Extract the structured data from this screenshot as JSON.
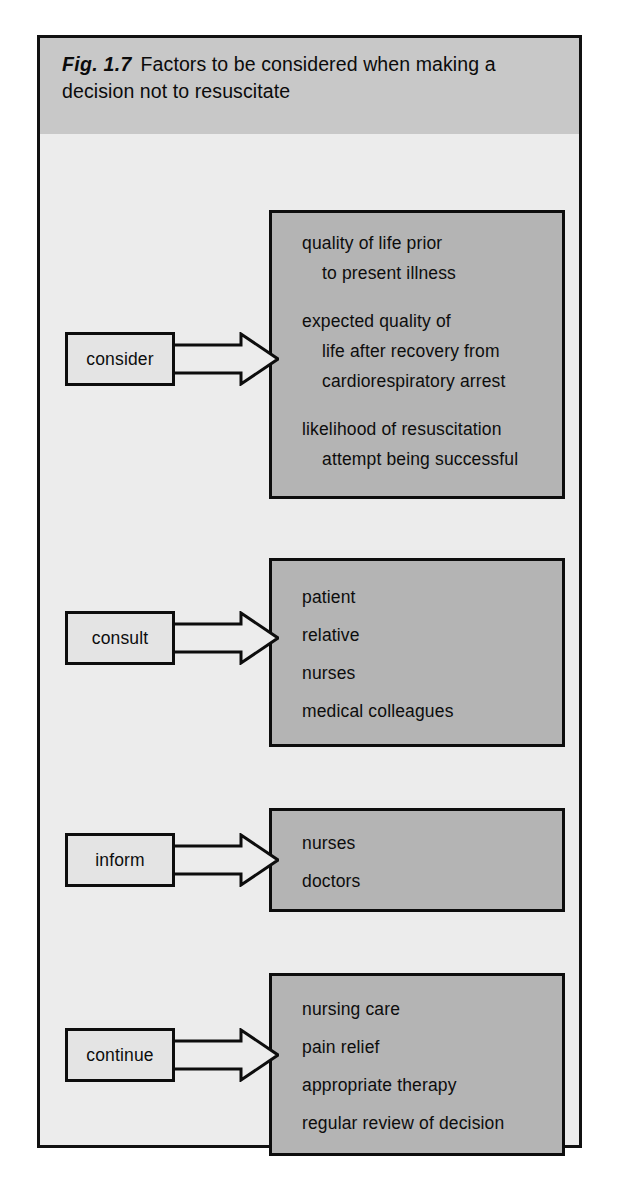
{
  "figure": {
    "caption_label": "Fig. 1.7",
    "caption_text": "Factors to be considered when making a decision not to resuscitate",
    "colors": {
      "page_background": "#ffffff",
      "frame_border": "#111111",
      "caption_band": "#c8c8c8",
      "panel_background": "#ececec",
      "content_box_fill": "#b4b4b4",
      "content_box_border": "#0d0d0d",
      "label_box_fill": "#e4e4e4",
      "arrow_fill": "#ececec",
      "text": "#0d0d0d"
    }
  },
  "rows": [
    {
      "label": "consider",
      "arrow_name": "arrow-consider",
      "items": [
        {
          "text": "quality of life prior",
          "indent": 0
        },
        {
          "text": "to present illness",
          "indent": 1
        },
        {
          "text": "",
          "indent": 0
        },
        {
          "text": "expected quality of",
          "indent": 0
        },
        {
          "text": "life after recovery from",
          "indent": 1
        },
        {
          "text": "cardiorespiratory arrest",
          "indent": 1
        },
        {
          "text": "",
          "indent": 0
        },
        {
          "text": "likelihood of resuscitation",
          "indent": 0
        },
        {
          "text": "attempt being successful",
          "indent": 1
        }
      ]
    },
    {
      "label": "consult",
      "arrow_name": "arrow-consult",
      "items": [
        {
          "text": "patient",
          "indent": 0
        },
        {
          "text": "relative",
          "indent": 0
        },
        {
          "text": "nurses",
          "indent": 0
        },
        {
          "text": "medical colleagues",
          "indent": 0
        }
      ]
    },
    {
      "label": "inform",
      "arrow_name": "arrow-inform",
      "items": [
        {
          "text": "nurses",
          "indent": 0
        },
        {
          "text": "doctors",
          "indent": 0
        }
      ]
    },
    {
      "label": "continue",
      "arrow_name": "arrow-continue",
      "items": [
        {
          "text": "nursing care",
          "indent": 0
        },
        {
          "text": "pain relief",
          "indent": 0
        },
        {
          "text": "appropriate therapy",
          "indent": 0
        },
        {
          "text": "regular review of decision",
          "indent": 0
        }
      ]
    }
  ],
  "layout": {
    "boxes": [
      {
        "left": 229,
        "top": 76,
        "width": 296,
        "height": 289,
        "pad_top": 22,
        "line_gap": 30,
        "blank_gap": 18
      },
      {
        "left": 229,
        "top": 424,
        "width": 296,
        "height": 189,
        "pad_top": 28,
        "line_gap": 38,
        "blank_gap": 0
      },
      {
        "left": 229,
        "top": 674,
        "width": 296,
        "height": 104,
        "pad_top": 24,
        "line_gap": 38,
        "blank_gap": 0
      },
      {
        "left": 229,
        "top": 839,
        "width": 296,
        "height": 183,
        "pad_top": 25,
        "line_gap": 38,
        "blank_gap": 0
      }
    ],
    "label_arrows": [
      {
        "left": 25,
        "top": 198
      },
      {
        "left": 25,
        "top": 477
      },
      {
        "left": 25,
        "top": 699
      },
      {
        "left": 25,
        "top": 894
      }
    ]
  }
}
